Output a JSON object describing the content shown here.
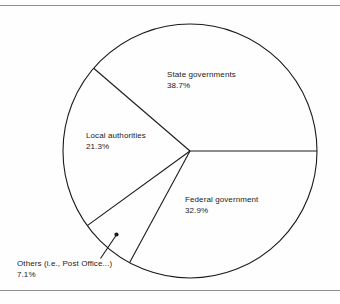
{
  "figure": {
    "background_color": "#fefefe",
    "line_color": "#1b1b1b",
    "rule_color": "#8d8d8d",
    "text_color": "#1b1b1b"
  },
  "labels": {
    "state": {
      "name": "State governments",
      "percent": "38.7%"
    },
    "local": {
      "name": "Local authorities",
      "percent": "21.3%"
    },
    "federal": {
      "name": "Federal government",
      "percent": "32.9%"
    },
    "others": {
      "name": "Others (i.e., Post Office...)",
      "percent": "7.1%"
    }
  },
  "chart_data": {
    "type": "pie",
    "title": "",
    "subtitle": "",
    "xlabel": "",
    "ylabel": "",
    "grid": false,
    "legend_position": "none",
    "labels_on_slices": true,
    "value_unit": "percent",
    "start_angle_deg": 0,
    "direction": "counterclockwise",
    "center": {
      "x": 190,
      "y": 151
    },
    "radius": 127,
    "categories": [
      "State governments",
      "Local authorities",
      "Others (i.e., Post Office...)",
      "Federal government"
    ],
    "values": [
      38.7,
      21.3,
      7.1,
      32.9
    ],
    "slices": [
      {
        "label": "State governments",
        "value": 38.7,
        "display": "38.7%",
        "start_deg": 0.0,
        "end_deg": 139.32,
        "leader_line": false
      },
      {
        "label": "Local authorities",
        "value": 21.3,
        "display": "21.3%",
        "start_deg": 139.32,
        "end_deg": 216.0,
        "leader_line": false
      },
      {
        "label": "Others (i.e., Post Office...)",
        "value": 7.1,
        "display": "7.1%",
        "start_deg": 216.0,
        "end_deg": 241.56,
        "leader_line": true
      },
      {
        "label": "Federal government",
        "value": 32.9,
        "display": "32.9%",
        "start_deg": 241.56,
        "end_deg": 360.0,
        "leader_line": false
      }
    ],
    "total": 100.0
  }
}
